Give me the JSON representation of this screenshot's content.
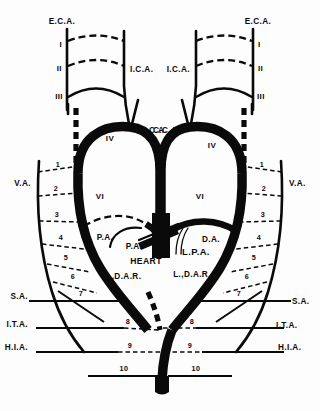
{
  "figure": {
    "type": "anatomical-diagram"
  },
  "labels": {
    "eca_left": "E.C.A.",
    "eca_right": "E.C.A.",
    "ica_left": "I.C.A.",
    "ica_right": "I.C.A.",
    "cca_left": "C.C.A.",
    "cca_right": "C.C.A.",
    "va_left": "V.A.",
    "va_right": "V.A.",
    "sa_left": "S.A.",
    "sa_right": "S.A.",
    "ita_left": "I.T.A.",
    "ita_right": "I.T.A.",
    "hia_left": "H.I.A.",
    "hia_right": "H.I.A.",
    "pa_upper": "P.A.",
    "pa_lower": "P.A.",
    "lpa": "L.P.A.",
    "da": "D.A.",
    "heart": "HEART",
    "rdar": "R.,D.A.R.",
    "ldar": "L.,D.A.R."
  },
  "arch_numerals": {
    "left": [
      "I",
      "II",
      "III",
      "IV",
      "VI"
    ],
    "right": [
      "I",
      "II",
      "III",
      "IV",
      "VI"
    ]
  },
  "segment_numbers": {
    "left": [
      "1",
      "2",
      "3",
      "4",
      "5",
      "6",
      "7",
      "8",
      "9",
      "10"
    ],
    "right": [
      "1",
      "2",
      "3",
      "4",
      "5",
      "6",
      "7",
      "8",
      "9",
      "10"
    ]
  },
  "colors": {
    "ink": "#0a0a0a",
    "background": "#fdfdfd"
  }
}
